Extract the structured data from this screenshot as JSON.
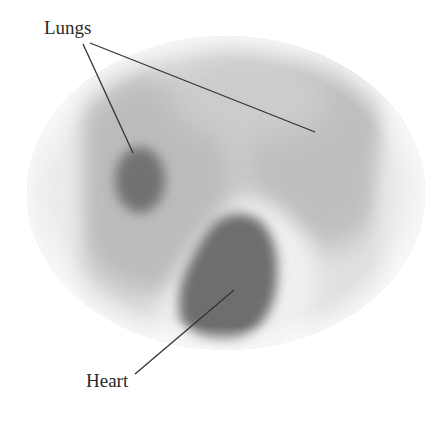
{
  "figure": {
    "type": "tomographic-cross-section",
    "labels": {
      "lungs": "Lungs",
      "heart": "Heart"
    },
    "colors": {
      "background": "#ffffff",
      "field_light": "#e4e4e4",
      "lung_region": "#bdbdbd",
      "lung_dark": "#6e6e6e",
      "heart_dark": "#6a6a6a",
      "leader_line": "#333333",
      "label_text": "#2a2a2a"
    },
    "regions": [
      {
        "name": "body-outline",
        "shape": "ellipse",
        "cx": 226,
        "cy": 193,
        "rx": 199,
        "ry": 157
      },
      {
        "name": "left-lung-dark-spot",
        "cx": 140,
        "cy": 180,
        "rx": 26,
        "ry": 35
      },
      {
        "name": "heart",
        "cx": 235,
        "cy": 265,
        "rx": 58,
        "ry": 62
      }
    ],
    "leader_lines": [
      {
        "from_label": "Lungs",
        "x1": 83,
        "y1": 44,
        "x2": 133,
        "y2": 153
      },
      {
        "from_label": "Lungs",
        "x1": 90,
        "y1": 43,
        "x2": 315,
        "y2": 132
      },
      {
        "from_label": "Heart",
        "x1": 135,
        "y1": 374,
        "x2": 234,
        "y2": 290
      }
    ]
  }
}
